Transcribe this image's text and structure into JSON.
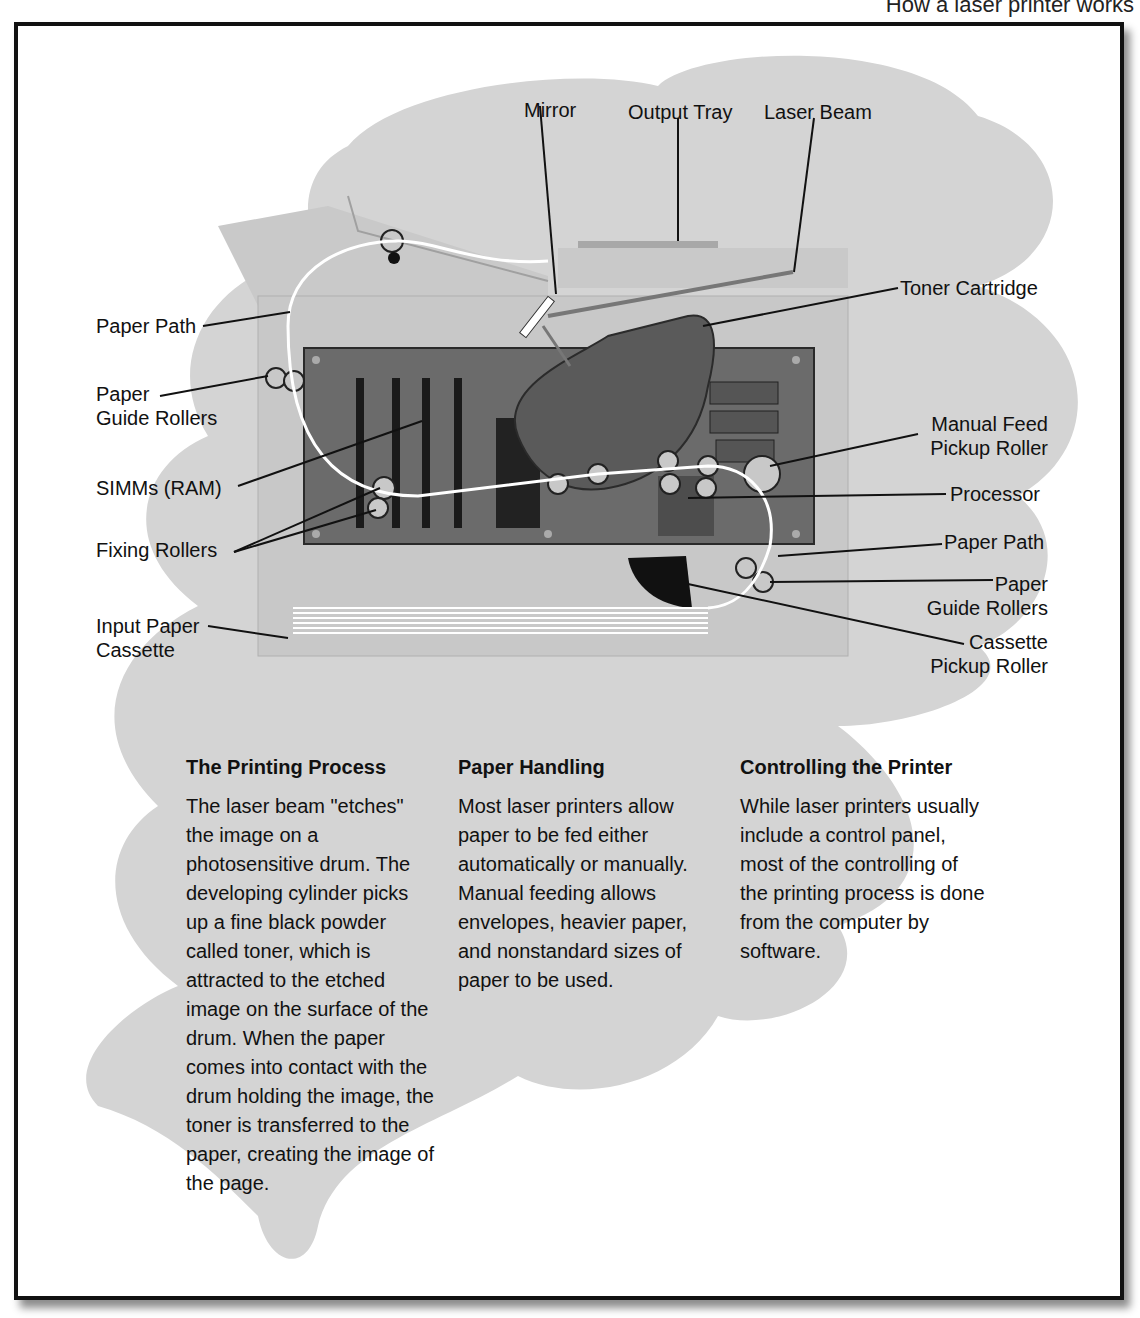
{
  "page_caption": "How a laser printer works",
  "diagram": {
    "labels_top": [
      {
        "id": "mirror",
        "text": "Mirror"
      },
      {
        "id": "output-tray",
        "text": "Output Tray"
      },
      {
        "id": "laser-beam",
        "text": "Laser Beam"
      }
    ],
    "labels_left": [
      {
        "id": "paper-path-left",
        "text": "Paper Path"
      },
      {
        "id": "paper-guide-rollers-left",
        "text": "Paper\nGuide Rollers"
      },
      {
        "id": "simms",
        "text": "SIMMs (RAM)"
      },
      {
        "id": "fixing-rollers",
        "text": "Fixing Rollers"
      },
      {
        "id": "input-paper-cassette",
        "text": "Input Paper\nCassette"
      }
    ],
    "labels_right": [
      {
        "id": "toner-cartridge",
        "text": "Toner Cartridge"
      },
      {
        "id": "manual-feed-pickup-roller",
        "text": "Manual Feed\nPickup Roller"
      },
      {
        "id": "processor",
        "text": "Processor"
      },
      {
        "id": "paper-path-right",
        "text": "Paper Path"
      },
      {
        "id": "paper-guide-rollers-right",
        "text": "Paper\nGuide Rollers"
      },
      {
        "id": "cassette-pickup-roller",
        "text": "Cassette\nPickup Roller"
      }
    ]
  },
  "sections": [
    {
      "heading": "The Printing Process",
      "body": "The laser beam \"etches\" the image on a photosensitive drum. The developing cylinder picks up a fine black powder called toner, which is attracted to the etched image on the surface of the drum. When the paper comes into contact with the drum holding the image, the toner is transferred to the paper, creating the image of the page."
    },
    {
      "heading": "Paper Handling",
      "body": "Most laser printers allow paper to be fed either automatically or manually. Manual feeding allows envelopes, heavier paper, and nonstandard sizes of paper to be used."
    },
    {
      "heading": "Controlling the Printer",
      "body": "While laser printers usually include a control panel, most of the controlling of the printing process is done from the computer by software."
    }
  ],
  "colors": {
    "blob": "#d2d2d2",
    "printer_body": "#c4c4c4",
    "board": "#6e6e6e",
    "cartridge": "#5a5a5a",
    "frame": "#111111"
  }
}
